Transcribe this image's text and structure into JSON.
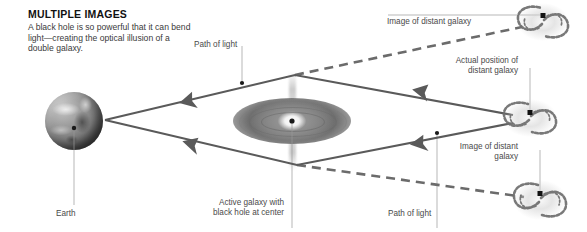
{
  "header": {
    "title": "MULTIPLE IMAGES",
    "description": "A black hole is so powerful that it can bend light—creating the optical illusion of a double galaxy."
  },
  "labels": {
    "path_of_light_top": "Path of light",
    "path_of_light_bottom": "Path of light",
    "earth": "Earth",
    "active_galaxy": "Active galaxy with\nblack hole at center",
    "image_top": "Image of distant galaxy",
    "actual_position": "Actual position of\ndistant galaxy",
    "image_bottom": "Image of distant\ngalaxy"
  },
  "diagram": {
    "type": "gravitational-lensing-schematic",
    "colors": {
      "ray": "#5a5a5a",
      "dashed_ray": "#6b6b6b",
      "leader": "#9a9a9a",
      "text": "#4a4a4a",
      "title": "#111111",
      "background": "#ffffff"
    },
    "objects": [
      {
        "name": "earth",
        "x": 74,
        "y": 121,
        "kind": "planet"
      },
      {
        "name": "active-galaxy",
        "x": 292,
        "y": 121,
        "kind": "edge-on-galaxy-with-jets"
      },
      {
        "name": "image-galaxy-top",
        "x": 543,
        "y": 22,
        "kind": "spiral-galaxy"
      },
      {
        "name": "actual-galaxy",
        "x": 530,
        "y": 118,
        "kind": "spiral-galaxy"
      },
      {
        "name": "image-galaxy-bottom",
        "x": 540,
        "y": 200,
        "kind": "spiral-galaxy"
      }
    ],
    "rays": [
      {
        "name": "upper-light-path",
        "style": "solid",
        "points": "105,120 295,75 513,115",
        "arrow_at": "187,98"
      },
      {
        "name": "lower-light-path",
        "style": "solid",
        "points": "105,120 297,165 513,122",
        "arrow_at": "190,143"
      },
      {
        "name": "upper-apparent-path",
        "style": "dashed",
        "points": "295,75 520,28"
      },
      {
        "name": "lower-apparent-path",
        "style": "dashed",
        "points": "297,165 522,196"
      }
    ]
  }
}
